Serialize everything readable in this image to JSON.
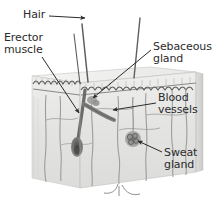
{
  "figure": {
    "background_color": "#ffffff",
    "text_color": "#2b2b2b",
    "style": "grayscale pencil-shaded 3D block illustration"
  },
  "labels": {
    "hair": "Hair",
    "erector_muscle": "Erector\nmuscle",
    "sebaceous_gland": "Sebaceous\ngland",
    "blood_vessels": "Blood\nvessels",
    "sweat_gland": "Sweat\ngland"
  },
  "structures": [
    {
      "name": "hair-shaft",
      "count": 3,
      "description": "thin dark shafts rising above skin surface"
    },
    {
      "name": "hair-follicle",
      "description": "dark bulb-tipped follicle descending into dermis"
    },
    {
      "name": "erector-muscle",
      "description": "diagonal muscle band attached to follicle"
    },
    {
      "name": "sebaceous-gland",
      "description": "small gland beside upper follicle"
    },
    {
      "name": "blood-vessels",
      "description": "branching vessel network through dermis"
    },
    {
      "name": "sweat-gland",
      "description": "coiled gland cluster in right dermis"
    },
    {
      "name": "epidermis",
      "description": "wavy dark dermal-epidermal junction line"
    },
    {
      "name": "skin-block",
      "description": "3D slab with top, front and right side faces"
    }
  ],
  "leader_lines": [
    {
      "for": "hair",
      "arrow": "right",
      "target": "hair-shaft"
    },
    {
      "for": "erector_muscle",
      "arrow": "down-right",
      "target": "erector-muscle"
    },
    {
      "for": "sebaceous_gland",
      "arrow": "down-left",
      "target": "sebaceous-gland"
    },
    {
      "for": "blood_vessels",
      "arrow": "left",
      "target": "blood-vessels"
    },
    {
      "for": "sweat_gland",
      "arrow": "up-left",
      "target": "sweat-gland"
    }
  ],
  "colors": {
    "block_face": "#e6e6e4",
    "block_top": "#f0f0ee",
    "block_side": "#d6d6d4",
    "line_dark": "#3a3a3a",
    "structure_gray": "#8a8a8a"
  }
}
